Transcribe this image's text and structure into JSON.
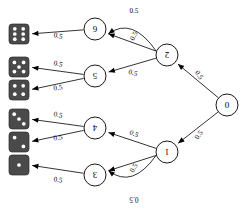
{
  "diagram": {
    "type": "binary-probability-tree",
    "orientation": "rotated-180",
    "root": "0",
    "edge_probability": "0.5",
    "colors": {
      "stroke": "#000000",
      "node_fill": "#ffffff",
      "die_fill": "#4a4a4a",
      "pip_fill": "#ffffff",
      "background": "#ffffff"
    }
  },
  "nodes": [
    {
      "id": "root",
      "label": "0",
      "cx": 227,
      "cy": 105,
      "r": 11
    },
    {
      "id": "n2",
      "label": "2",
      "cx": 167,
      "cy": 55,
      "r": 11
    },
    {
      "id": "n1",
      "label": "1",
      "cx": 167,
      "cy": 152,
      "r": 11
    },
    {
      "id": "n6",
      "label": "6",
      "cx": 95,
      "cy": 29,
      "r": 11
    },
    {
      "id": "n5",
      "label": "5",
      "cx": 95,
      "cy": 76,
      "r": 11
    },
    {
      "id": "n4",
      "label": "4",
      "cx": 95,
      "cy": 128,
      "r": 11
    },
    {
      "id": "n3",
      "label": "3",
      "cx": 95,
      "cy": 175,
      "r": 11
    }
  ],
  "dice": [
    {
      "id": "die-6",
      "pips": 6,
      "x": 9,
      "y": 24,
      "size": 20
    },
    {
      "id": "die-5",
      "pips": 5,
      "x": 9,
      "y": 57,
      "size": 20
    },
    {
      "id": "die-4",
      "pips": 4,
      "x": 9,
      "y": 80,
      "size": 20
    },
    {
      "id": "die-3",
      "pips": 3,
      "x": 9,
      "y": 109,
      "size": 20
    },
    {
      "id": "die-2",
      "pips": 2,
      "x": 9,
      "y": 132,
      "size": 20
    },
    {
      "id": "die-1",
      "pips": 1,
      "x": 9,
      "y": 155,
      "size": 20
    }
  ],
  "edges": [
    {
      "id": "e-root-2",
      "from": "root",
      "to": "n2",
      "label": "0.5",
      "lx": 199,
      "ly": 75,
      "rot": 235
    },
    {
      "id": "e-root-1",
      "from": "root",
      "to": "n1",
      "label": "0.5",
      "lx": 199,
      "ly": 135,
      "rot": 128
    },
    {
      "id": "e-2-6",
      "from": "n2",
      "to": "n6",
      "label": "0.5",
      "lx": 134,
      "ly": 36,
      "rot": 118
    },
    {
      "id": "e-2-6-arc",
      "from": "n2",
      "to": "n6",
      "label": "0.5",
      "lx": 134,
      "ly": 11,
      "rot": 182
    },
    {
      "id": "e-2-5",
      "from": "n2",
      "to": "n5",
      "label": "0.5",
      "lx": 133,
      "ly": 73,
      "rot": 196
    },
    {
      "id": "e-1-4",
      "from": "n1",
      "to": "n4",
      "label": "0.5",
      "lx": 134,
      "ly": 134,
      "rot": 202
    },
    {
      "id": "e-1-3",
      "from": "n1",
      "to": "n3",
      "label": "0.5",
      "lx": 134,
      "ly": 168,
      "rot": 119
    },
    {
      "id": "e-1-3-arc",
      "from": "n1",
      "to": "n3",
      "label": "0.5",
      "lx": 134,
      "ly": 199,
      "rot": 0
    },
    {
      "id": "e-6-d6",
      "from": "n6",
      "to": "die-6",
      "label": "0.5",
      "lx": 58,
      "ly": 36,
      "rot": 193
    },
    {
      "id": "e-5-d5",
      "from": "n5",
      "to": "die-5",
      "label": "0.5",
      "lx": 58,
      "ly": 64,
      "rot": 193
    },
    {
      "id": "e-5-d4",
      "from": "n5",
      "to": "die-4",
      "label": "0.5",
      "lx": 58,
      "ly": 88,
      "rot": 172
    },
    {
      "id": "e-4-d3",
      "from": "n4",
      "to": "die-3",
      "label": "0.5",
      "lx": 58,
      "ly": 115,
      "rot": 192
    },
    {
      "id": "e-4-d2",
      "from": "n4",
      "to": "die-2",
      "label": "0.5",
      "lx": 58,
      "ly": 138,
      "rot": 172
    },
    {
      "id": "e-3-d1",
      "from": "n3",
      "to": "die-1",
      "label": "0.5",
      "lx": 58,
      "ly": 180,
      "rot": 190
    }
  ]
}
